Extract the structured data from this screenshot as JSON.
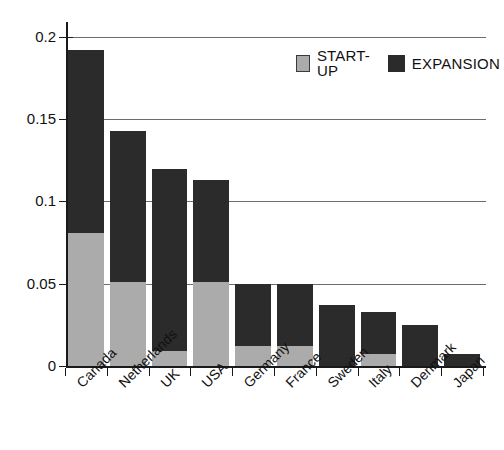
{
  "chart_data": {
    "type": "bar",
    "subtype": "stacked-bar",
    "title": "",
    "subtitle": "",
    "xlabel": "",
    "ylabel": "",
    "ylim": [
      0,
      0.2
    ],
    "y_ticks": [
      0,
      0.05,
      0.1,
      0.15,
      0.2
    ],
    "y_tick_labels": [
      "0",
      "0.05",
      "0.1",
      "0.15",
      "0.2"
    ],
    "grid": "horizontal",
    "legend_position": "top-right",
    "categories": [
      "Canada",
      "Netherlands",
      "UK",
      "USA",
      "Germany",
      "France",
      "Sweden",
      "Italy",
      "Denmark",
      "Japan"
    ],
    "series": [
      {
        "name": "START-UP",
        "color": "#ababab",
        "values": [
          0.081,
          0.051,
          0.009,
          0.051,
          0.012,
          0.012,
          0.0,
          0.007,
          0.0,
          0.0
        ]
      },
      {
        "name": "EXPANSION",
        "color": "#2b2b2b",
        "values": [
          0.111,
          0.092,
          0.111,
          0.062,
          0.038,
          0.038,
          0.037,
          0.026,
          0.025,
          0.007
        ]
      }
    ],
    "totals": [
      0.192,
      0.143,
      0.12,
      0.113,
      0.05,
      0.05,
      0.037,
      0.033,
      0.025,
      0.007
    ]
  },
  "legend": {
    "items": [
      {
        "label": "START-UP",
        "color": "#ababab",
        "swatch_name": "legend-swatch-startup"
      },
      {
        "label": "EXPANSION",
        "color": "#2b2b2b",
        "swatch_name": "legend-swatch-expansion"
      }
    ]
  },
  "axes": {
    "y_tick_labels": [
      "0.2",
      "0.15",
      "0.1",
      "0.05",
      "0"
    ],
    "x_tick_labels": [
      "Canada",
      "Netherlands",
      "UK",
      "USA",
      "Germany",
      "France",
      "Sweden",
      "Italy",
      "Denmark",
      "Japan"
    ]
  },
  "colors": {
    "startup": "#ababab",
    "expansion": "#2b2b2b",
    "axis": "#1a1a1a",
    "gridline": "#6d6d6d",
    "background": "#ffffff",
    "text": "#111111"
  }
}
